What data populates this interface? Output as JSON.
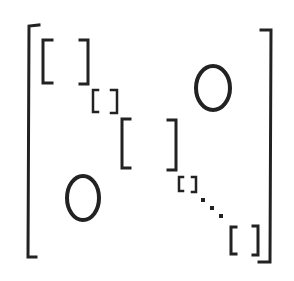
{
  "diagram": {
    "off_diagonal_upper": "0",
    "off_diagonal_lower": "0",
    "blocks": [
      {
        "x": 41,
        "y": 39,
        "w": 48,
        "h": 45
      },
      {
        "x": 92,
        "y": 90,
        "w": 25,
        "h": 23
      },
      {
        "x": 120,
        "y": 118,
        "w": 56,
        "h": 52
      },
      {
        "x": 179,
        "y": 177,
        "w": 17,
        "h": 15
      },
      {
        "x": 230,
        "y": 226,
        "w": 29,
        "h": 29
      }
    ],
    "ellipsis": "⋱",
    "stroke_color": "#222222"
  }
}
